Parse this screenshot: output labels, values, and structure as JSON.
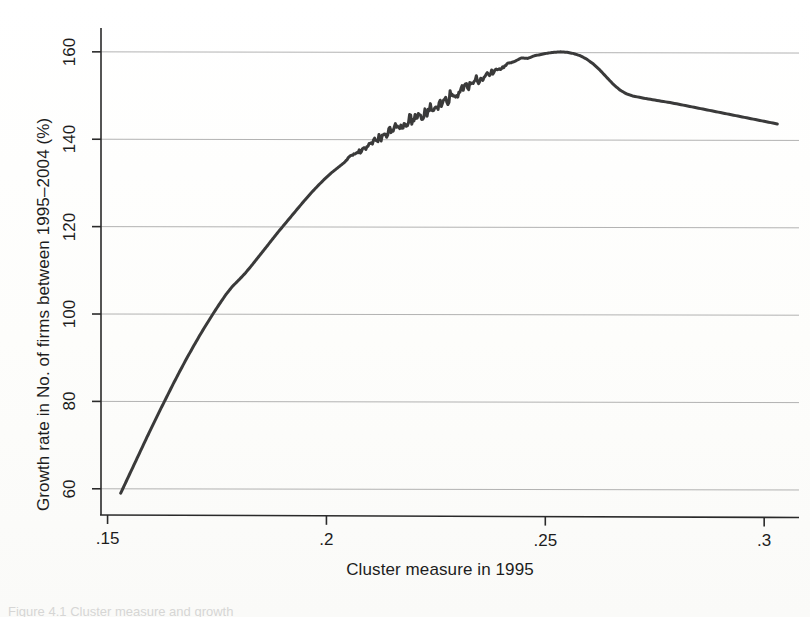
{
  "figure": {
    "caption_partial": "Figure 4.1 Cluster measure and growth"
  },
  "chart_data": {
    "type": "line",
    "title": "",
    "xlabel": "Cluster measure in 1995",
    "ylabel": "Growth rate in No. of firms between 1995–2004 (%)",
    "xlim": [
      0.1485,
      0.3075
    ],
    "ylim": [
      54,
      165
    ],
    "xticks": [
      0.15,
      0.2,
      0.25,
      0.3
    ],
    "xtick_labels": [
      ".15",
      ".2",
      ".25",
      ".3"
    ],
    "yticks": [
      60,
      80,
      100,
      120,
      140,
      160
    ],
    "ytick_labels": [
      "60",
      "80",
      "100",
      "120",
      "140",
      "160"
    ],
    "grid": "horizontal",
    "legend": "none",
    "line_color": "#3a3a3a",
    "grid_color": "#9a9a9a",
    "axis_color": "#2a2a2a",
    "series": [
      {
        "name": "Local polynomial smooth of growth rate",
        "x": [
          0.153,
          0.1545,
          0.156,
          0.1575,
          0.159,
          0.1605,
          0.162,
          0.1635,
          0.165,
          0.1665,
          0.168,
          0.1695,
          0.171,
          0.1725,
          0.174,
          0.1755,
          0.177,
          0.1785,
          0.18,
          0.1815,
          0.183,
          0.1845,
          0.186,
          0.1875,
          0.189,
          0.1905,
          0.192,
          0.1935,
          0.195,
          0.1965,
          0.198,
          0.1995,
          0.201,
          0.2025,
          0.204,
          0.2055,
          0.207,
          0.2085,
          0.21,
          0.2115,
          0.213,
          0.2145,
          0.216,
          0.2175,
          0.219,
          0.2205,
          0.222,
          0.2235,
          0.225,
          0.2265,
          0.228,
          0.2295,
          0.231,
          0.2325,
          0.234,
          0.2355,
          0.237,
          0.2385,
          0.24,
          0.2415,
          0.243,
          0.2445,
          0.246,
          0.2475,
          0.249,
          0.2505,
          0.252,
          0.2535,
          0.255,
          0.2565,
          0.258,
          0.2595,
          0.261,
          0.2625,
          0.264,
          0.2655,
          0.267,
          0.2685,
          0.27,
          0.273,
          0.276,
          0.279,
          0.282,
          0.285,
          0.288,
          0.291,
          0.294,
          0.297,
          0.3,
          0.303
        ],
        "y": [
          59.0,
          62.2,
          65.4,
          68.6,
          71.8,
          74.9,
          78.0,
          81.0,
          84.0,
          86.9,
          89.7,
          92.4,
          95.0,
          97.5,
          99.9,
          102.2,
          104.4,
          106.3,
          107.8,
          109.4,
          111.2,
          113.1,
          115.0,
          116.9,
          118.8,
          120.6,
          122.4,
          124.2,
          126.0,
          127.7,
          129.3,
          130.8,
          132.2,
          133.4,
          134.6,
          136.2,
          136.8,
          137.6,
          139.2,
          139.9,
          140.7,
          142.0,
          142.6,
          143.1,
          144.4,
          144.9,
          145.6,
          146.8,
          147.3,
          148.2,
          149.6,
          150.1,
          151.5,
          152.2,
          153.4,
          154.1,
          154.8,
          155.6,
          156.2,
          157.3,
          157.8,
          158.6,
          158.5,
          159.1,
          159.4,
          159.7,
          159.9,
          160.0,
          159.9,
          159.6,
          159.1,
          158.3,
          157.2,
          155.8,
          154.2,
          152.6,
          151.3,
          150.4,
          149.9,
          149.3,
          148.8,
          148.3,
          147.7,
          147.1,
          146.5,
          145.9,
          145.3,
          144.7,
          144.1,
          143.5
        ],
        "noise_band": {
          "x_start": 0.204,
          "x_end": 0.243,
          "description": "visible high-frequency wiggle on the rising limb"
        }
      }
    ],
    "annotations": [
      {
        "text": "peak",
        "x": 0.2535,
        "y": 160.0,
        "shown": false
      }
    ]
  }
}
